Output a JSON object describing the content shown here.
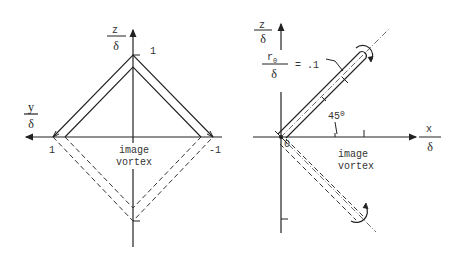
{
  "left_panel": {
    "vertical_axis": {
      "label_top": "z",
      "label_bottom": "δ"
    },
    "horizontal_axis": {
      "label_top": "y",
      "label_bottom": "δ"
    },
    "tick_labels": {
      "z_one": "1",
      "y_pos_one": "1",
      "y_neg_one": "-1"
    },
    "image_caption": [
      "image",
      "vortex"
    ]
  },
  "right_panel": {
    "vertical_axis": {
      "label_top": "z",
      "label_bottom": "δ"
    },
    "horizontal_axis": {
      "label_top": "x",
      "label_bottom": "δ"
    },
    "radius_label": {
      "numerator": "r",
      "subscript": "0",
      "denominator": "δ",
      "value": "= .1"
    },
    "angle_label": "45",
    "angle_unit": "0",
    "origin_label": "0",
    "image_caption": [
      "image",
      "vortex"
    ]
  },
  "colors": {
    "line": "#222222",
    "text": "#333333",
    "background": "#ffffff"
  }
}
